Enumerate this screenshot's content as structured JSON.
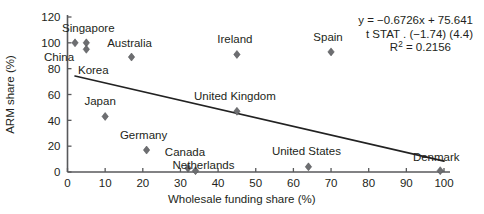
{
  "chart_data": {
    "type": "scatter",
    "title": "",
    "xlabel": "Wholesale funding share (%)",
    "ylabel": "ARM share (%)",
    "xlim": [
      0,
      100
    ],
    "ylim": [
      0,
      120
    ],
    "xticks": [
      0,
      10,
      20,
      30,
      40,
      50,
      60,
      70,
      80,
      90,
      100
    ],
    "yticks": [
      0,
      20,
      40,
      60,
      80,
      100,
      120
    ],
    "xtick_labels": [
      "0",
      "10",
      "20",
      "30",
      "40",
      "50",
      "60",
      "70",
      "80",
      "90",
      "100"
    ],
    "ytick_labels": [
      "0",
      "20",
      "40",
      "60",
      "80",
      "100",
      "120"
    ],
    "grid": false,
    "legend": "none",
    "points": [
      {
        "label": "China",
        "x": 2,
        "y": 100,
        "label_dx": -16,
        "label_dy": 18
      },
      {
        "label": "Singapore",
        "x": 5,
        "y": 100,
        "label_dx": 2,
        "label_dy": -11
      },
      {
        "label": "Korea",
        "x": 5,
        "y": 95,
        "label_dx": 7,
        "label_dy": 25
      },
      {
        "label": "Australia",
        "x": 17,
        "y": 89,
        "label_dx": -2,
        "label_dy": -10
      },
      {
        "label": "Japan",
        "x": 10,
        "y": 43,
        "label_dx": -5,
        "label_dy": -11
      },
      {
        "label": "Germany",
        "x": 21,
        "y": 17,
        "label_dx": -3,
        "label_dy": -11
      },
      {
        "label": "Canada",
        "x": 32,
        "y": 3,
        "label_dx": -3,
        "label_dy": -12
      },
      {
        "label": "Netherlands",
        "x": 34,
        "y": 1,
        "label_dx": 8,
        "label_dy": -2
      },
      {
        "label": "Ireland",
        "x": 45,
        "y": 91,
        "label_dx": -2,
        "label_dy": -11
      },
      {
        "label": "United Kingdom",
        "x": 45,
        "y": 47,
        "label_dx": -2,
        "label_dy": -11
      },
      {
        "label": "Spain",
        "x": 70,
        "y": 93,
        "label_dx": -3,
        "label_dy": -11
      },
      {
        "label": "United States",
        "x": 64,
        "y": 4,
        "label_dx": -2,
        "label_dy": -12
      },
      {
        "label": "Denmark",
        "x": 99,
        "y": 1,
        "label_dx": -4,
        "label_dy": -10
      }
    ],
    "trendline": {
      "slope": -0.6726,
      "intercept": 75.641,
      "x_start": 2,
      "x_end": 100,
      "y_start": 74.3,
      "y_end": 8.4
    },
    "annotation": {
      "equation": "y = −0.6726x + 75.641",
      "tstat": "t STAT . (−1.74) (4.4)",
      "r2_prefix": "R",
      "r2_sup": "2",
      "r2_value": " = 0.2156"
    }
  },
  "colors": {
    "marker": "#6d6e71",
    "axis": "#58595b",
    "trend": "#222222",
    "text": "#231f20",
    "background": "#ffffff"
  }
}
